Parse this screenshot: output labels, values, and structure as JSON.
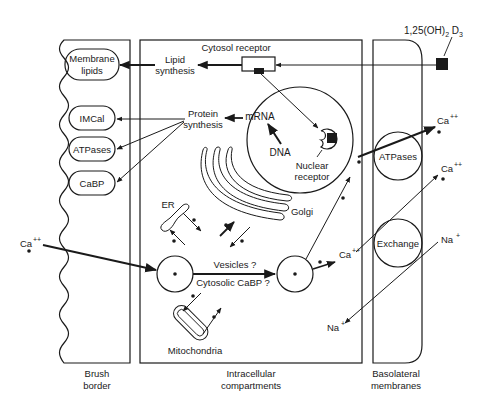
{
  "diagram": {
    "hormone": {
      "label_main": "1,25(OH)",
      "label_sub": "2",
      "label_tail": " D",
      "label_sub2": "3"
    },
    "regions": {
      "brush_border": {
        "line1": "Brush",
        "line2": "border"
      },
      "intracellular": {
        "line1": "Intracellular",
        "line2": "compartments"
      },
      "basolateral": {
        "line1": "Basolateral",
        "line2": "membranes"
      }
    },
    "brush_border_items": [
      {
        "id": "membrane-lipids",
        "line1": "Membrane",
        "line2": "lipids"
      },
      {
        "id": "imcal",
        "line1": "IMCal"
      },
      {
        "id": "atpases",
        "line1": "ATPases"
      },
      {
        "id": "cabp",
        "line1": "CaBP"
      }
    ],
    "intracellular_labels": {
      "cytosol_receptor": "Cytosol receptor",
      "lipid_synthesis_1": "Lipid",
      "lipid_synthesis_2": "synthesis",
      "protein_synthesis_1": "Protein",
      "protein_synthesis_2": "synthesis",
      "mrna": "mRNA",
      "dna": "DNA",
      "nuclear_receptor_1": "Nuclear",
      "nuclear_receptor_2": "receptor",
      "er": "ER",
      "golgi": "Golgi",
      "vesicles": "Vesicles ?",
      "cytosolic_cabp": "Cytosolic CaBP ?",
      "mitochondria": "Mitochondria"
    },
    "basolateral_items": {
      "atpases": "ATPases",
      "exchange": "Exchange"
    },
    "ions": {
      "ca_in": "Ca",
      "ca_out_top": "Ca",
      "ca_out_mid": "Ca",
      "ca_cell": "Ca",
      "charge_ca": "++",
      "na_out": "Na",
      "na_in": "Na",
      "charge_na": "+"
    },
    "colors": {
      "ink": "#1a1a1a",
      "background": "#ffffff"
    }
  }
}
